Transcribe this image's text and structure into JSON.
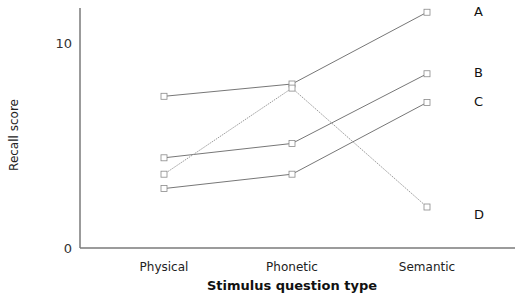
{
  "chart_data": {
    "type": "line",
    "title": "",
    "xlabel": "Stimulus question type",
    "ylabel": "Recall score",
    "categories": [
      "Physical",
      "Phonetic",
      "Semantic"
    ],
    "ylim": [
      0,
      12
    ],
    "yticks": [
      0,
      10
    ],
    "ytick_labels": [
      "0",
      "10"
    ],
    "grid": false,
    "legend": "direct labels at right end of each line",
    "series": [
      {
        "name": "A",
        "values": [
          7.4,
          8.0,
          11.5
        ],
        "style": "solid"
      },
      {
        "name": "B",
        "values": [
          4.4,
          5.1,
          8.5
        ],
        "style": "solid"
      },
      {
        "name": "C",
        "values": [
          2.9,
          3.6,
          7.1
        ],
        "style": "solid"
      },
      {
        "name": "D",
        "values": [
          3.6,
          7.8,
          2.0
        ],
        "style": "dotted"
      }
    ]
  },
  "colors": {
    "axis": "#7a7a7a",
    "line": "#777777",
    "dotted_line": "#9a9a9a",
    "marker_stroke": "#8a8a8a"
  }
}
